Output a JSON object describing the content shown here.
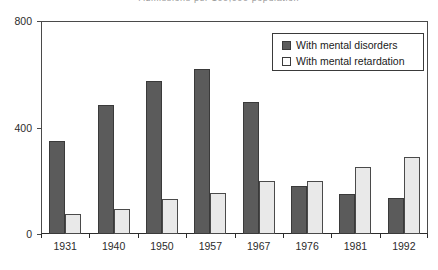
{
  "chart_data": {
    "type": "bar",
    "title": "Admissions per 100,000 population",
    "xlabel": "",
    "ylabel": "",
    "categories": [
      "1931",
      "1940",
      "1950",
      "1957",
      "1967",
      "1976",
      "1981",
      "1992"
    ],
    "series": [
      {
        "name": "With mental disorders",
        "color": "#5b5b5b",
        "values": [
          350,
          485,
          575,
          620,
          495,
          180,
          150,
          135
        ]
      },
      {
        "name": "With mental retardation",
        "color": "#e9e9e9",
        "values": [
          75,
          95,
          130,
          155,
          200,
          200,
          250,
          290
        ]
      }
    ],
    "ylim": [
      0,
      800
    ],
    "yticks": [
      0,
      400,
      800
    ],
    "ytick_labels": [
      "0",
      "400",
      "800"
    ],
    "grid": false,
    "legend_position": "top-right"
  },
  "legend": {
    "entries": [
      {
        "label": "With mental disorders",
        "swatch": "dark"
      },
      {
        "label": "With mental retardation",
        "swatch": "light"
      }
    ]
  }
}
